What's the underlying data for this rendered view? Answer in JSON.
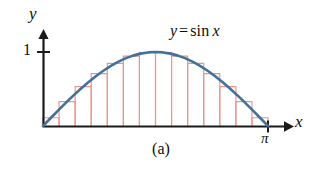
{
  "figure": {
    "caption": "(a)",
    "axis_labels": {
      "x": "x",
      "y": "y"
    },
    "tick_labels": {
      "y_one": "1",
      "x_pi": "π"
    },
    "curve_label": {
      "lhs": "y",
      "equals": "=",
      "function": "sin",
      "variable": "x",
      "full": "y = sin x"
    }
  },
  "colors": {
    "curve": "#41719c",
    "rectangle_stroke": "#e8968a",
    "axis": "#1a1a1a",
    "text": "#0d0d0d",
    "background": "#ffffff"
  },
  "chart_data": {
    "type": "area",
    "title": "",
    "subtitle": "",
    "xlabel": "x",
    "ylabel": "y",
    "xlim": [
      0,
      3.141592653589793
    ],
    "ylim": [
      0,
      1.15
    ],
    "grid": false,
    "legend_position": "none",
    "annotations": [
      "y = sin x",
      "(a)"
    ],
    "x_tick_values": [
      3.141592653589793
    ],
    "x_tick_labels": [
      "π"
    ],
    "y_tick_values": [
      1
    ],
    "y_tick_labels": [
      "1"
    ],
    "series": [
      {
        "name": "y = sin x",
        "type": "line",
        "color": "#41719c",
        "x": [
          0,
          0.1047,
          0.2094,
          0.3142,
          0.4189,
          0.5236,
          0.6283,
          0.733,
          0.8378,
          0.9425,
          1.0472,
          1.1519,
          1.2566,
          1.3614,
          1.4661,
          1.5708,
          1.6755,
          1.7802,
          1.885,
          1.9897,
          2.0944,
          2.1991,
          2.3038,
          2.4086,
          2.5133,
          2.618,
          2.7227,
          2.8274,
          2.9322,
          3.0369,
          3.1416
        ],
        "y": [
          0,
          0.1045,
          0.2079,
          0.309,
          0.4067,
          0.5,
          0.5878,
          0.6691,
          0.7431,
          0.809,
          0.866,
          0.9135,
          0.9511,
          0.9781,
          0.9945,
          1.0,
          0.9945,
          0.9781,
          0.9511,
          0.9135,
          0.866,
          0.809,
          0.7431,
          0.6691,
          0.5878,
          0.5,
          0.4067,
          0.309,
          0.2079,
          0.1045,
          0.0
        ]
      },
      {
        "name": "Midpoint rectangles",
        "type": "bar",
        "rule": "midpoint",
        "color": "#e8968a",
        "n": 14,
        "interval": [
          0,
          3.141592653589793
        ],
        "bar_width": 0.2244,
        "midpoints": [
          0.1122,
          0.3366,
          0.561,
          0.7854,
          1.0098,
          1.2342,
          1.4586,
          1.683,
          1.9074,
          2.1318,
          2.3562,
          2.5806,
          2.805,
          3.0294
        ],
        "heights": [
          0.112,
          0.3303,
          0.5321,
          0.7071,
          0.846,
          0.9439,
          0.9937,
          0.9937,
          0.9439,
          0.846,
          0.7071,
          0.5321,
          0.3303,
          0.112
        ]
      }
    ]
  },
  "geometry": {
    "origin_px": {
      "x": 43,
      "y": 126
    },
    "x_end_px": 268,
    "y_one_px": 52,
    "x_arrow_tip_px": 291,
    "y_arrow_tip_px": 31
  }
}
